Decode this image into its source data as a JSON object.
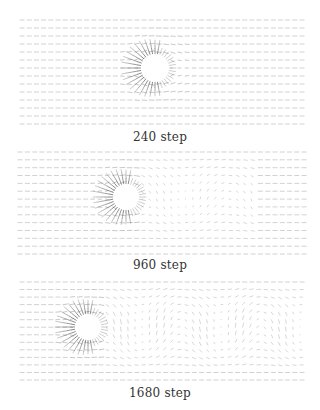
{
  "figure": {
    "colors": {
      "arrow": "#555555",
      "background": "#ffffff",
      "caption": "#333333"
    },
    "panels": [
      {
        "caption": "240 step",
        "step": 240,
        "field": {
          "x0": 20,
          "x1": 300,
          "y0": 20,
          "y1": 124,
          "rows": 14,
          "cols": 40
        },
        "cylinder": {
          "cx": 155,
          "cy": 68,
          "r": 13
        },
        "wake": {
          "amplitude": 0,
          "length": 40,
          "wavelength": 60
        },
        "caption_y": 130
      },
      {
        "caption": "960 step",
        "step": 960,
        "field": {
          "x0": 18,
          "x1": 302,
          "y0": 152,
          "y1": 254,
          "rows": 14,
          "cols": 40
        },
        "cylinder": {
          "cx": 126,
          "cy": 197,
          "r": 12
        },
        "wake": {
          "amplitude": 0.5,
          "length": 120,
          "wavelength": 90
        },
        "caption_y": 258
      },
      {
        "caption": "1680 step",
        "step": 1680,
        "field": {
          "x0": 20,
          "x1": 300,
          "y0": 282,
          "y1": 380,
          "rows": 14,
          "cols": 40
        },
        "cylinder": {
          "cx": 88,
          "cy": 327,
          "r": 12
        },
        "wake": {
          "amplitude": 1.0,
          "length": 220,
          "wavelength": 80
        },
        "caption_y": 386
      }
    ]
  }
}
